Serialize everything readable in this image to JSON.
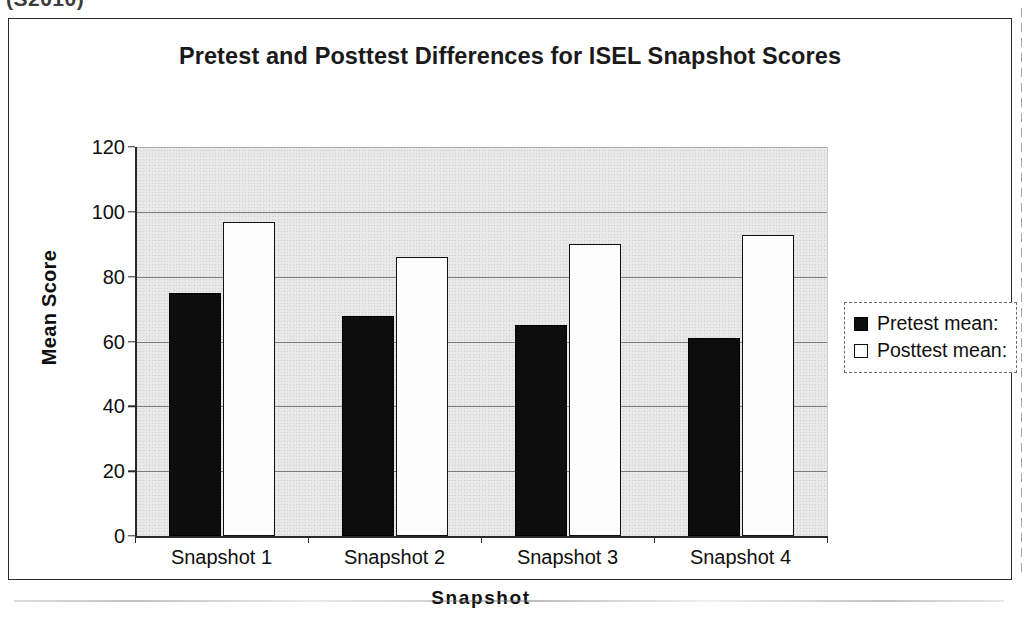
{
  "clipped_header": "(S2010)",
  "chart_data": {
    "type": "bar",
    "title": "Pretest and Posttest Differences for ISEL Snapshot Scores",
    "xlabel": "Snapshot",
    "ylabel": "Mean Score",
    "categories": [
      "Snapshot 1",
      "Snapshot 2",
      "Snapshot 3",
      "Snapshot 4"
    ],
    "series": [
      {
        "name": "Pretest mean:",
        "values": [
          75,
          68,
          65,
          61
        ],
        "swatch": "filled",
        "color": "#0d0d0d"
      },
      {
        "name": "Posttest mean:",
        "values": [
          97,
          86,
          90,
          93
        ],
        "swatch": "hollow",
        "color": "#ffffff"
      }
    ],
    "ylim": [
      0,
      120
    ],
    "yticks": [
      120,
      100,
      80,
      60,
      40,
      20,
      0
    ],
    "ytick_labels": [
      "120",
      "100",
      "80",
      "60",
      "40",
      "20",
      "0"
    ],
    "grid": true,
    "legend_position": "right",
    "plot_background": "#e9e9e9"
  }
}
